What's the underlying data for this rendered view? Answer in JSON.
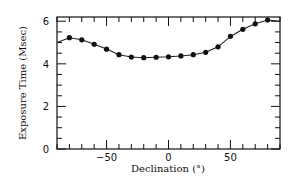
{
  "chart_data": {
    "type": "line",
    "title": "",
    "xlabel": "Declination (°)",
    "ylabel": "Exposure Time (Msec)",
    "xlim": [
      -90,
      90
    ],
    "ylim": [
      0,
      6.2
    ],
    "xticks_major": [
      -50,
      0,
      50
    ],
    "xticks_minor_step": 10,
    "yticks_major": [
      0,
      2,
      4,
      6
    ],
    "yticks_minor_step": 0.5,
    "grid": false,
    "legend": null,
    "series": [
      {
        "name": "Exposure Time",
        "marker": "filled-circle",
        "line_start": {
          "x": -90,
          "y": 5.0
        },
        "line_end": {
          "x": 90,
          "y": 6.0
        },
        "x": [
          -80,
          -70,
          -60,
          -50,
          -40,
          -30,
          -20,
          -10,
          0,
          10,
          20,
          30,
          40,
          50,
          60,
          70,
          80
        ],
        "values": [
          5.23,
          5.13,
          4.92,
          4.69,
          4.43,
          4.32,
          4.29,
          4.31,
          4.33,
          4.37,
          4.43,
          4.54,
          4.8,
          5.29,
          5.62,
          5.88,
          6.06
        ]
      }
    ]
  },
  "labels": {
    "x_title": "Declination (°)",
    "y_title": "Exposure Time (Msec)"
  },
  "colors": {
    "line": "#222222",
    "marker": "#111111",
    "axis": "#111111"
  }
}
